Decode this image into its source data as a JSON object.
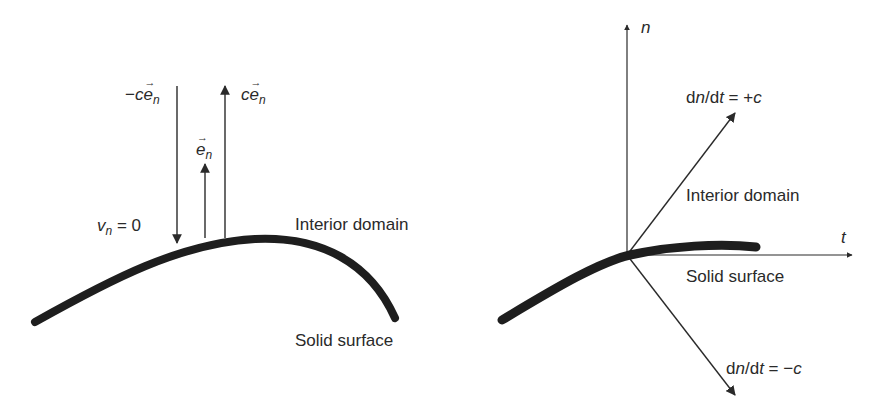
{
  "figure": {
    "left_panel": {
      "labels": {
        "neg_c_prefix": "−",
        "c": "c",
        "e": "e",
        "n_sub": "n",
        "vector_arrow": "→",
        "vn_v": "v",
        "vn_eq": " = 0",
        "interior_domain": "Interior domain",
        "solid_surface": "Solid surface"
      },
      "arrows": [
        {
          "name": "-c e_n",
          "direction": "down",
          "x": 177,
          "y_from": 86,
          "y_to": 243
        },
        {
          "name": "e_n",
          "direction": "up",
          "x": 205,
          "y_from": 238,
          "y_to": 164
        },
        {
          "name": "c e_n",
          "direction": "up",
          "x": 225,
          "y_from": 238,
          "y_to": 86
        }
      ]
    },
    "right_panel": {
      "labels": {
        "n_axis": "n",
        "t_axis": "t",
        "d": "d",
        "n": "n",
        "slash_d": "/d",
        "t": "t",
        "plus_c_rhs": " = +",
        "minus_c_rhs": " = −",
        "c": "c",
        "interior_domain": "Interior domain",
        "solid_surface": "Solid surface"
      },
      "characteristics": [
        {
          "name": "dn/dt = +c",
          "to": [
            735,
            113
          ]
        },
        {
          "name": "dn/dt = -c",
          "to": [
            735,
            395
          ]
        }
      ]
    },
    "colors": {
      "ink": "#2a2a2a",
      "surface": "#1e1e1e",
      "background": "#ffffff"
    }
  }
}
